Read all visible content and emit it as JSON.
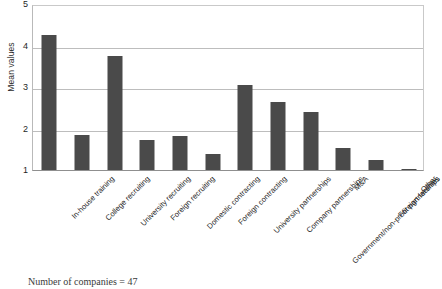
{
  "chart_data": {
    "type": "bar",
    "title": "",
    "xlabel": "",
    "ylabel": "Mean values",
    "ylim": [
      1,
      5
    ],
    "yticks": [
      1,
      2,
      3,
      4,
      5
    ],
    "ytick_labels": [
      "1",
      "2",
      "3",
      "4",
      "5"
    ],
    "grid": true,
    "legend": false,
    "bar_color": "#4a4a4a",
    "categories": [
      "In-house training",
      "College recruiting",
      "University recruiting",
      "Foreign recruiting",
      "Domestic contracting",
      "Foreign contracting",
      "University partnerships",
      "Company partnerships",
      "Government/non-profit partnerships",
      "M&A",
      "Foreign facilities",
      "Other"
    ],
    "values": [
      4.26,
      1.85,
      3.75,
      1.73,
      1.82,
      1.38,
      3.06,
      2.65,
      2.39,
      1.54,
      1.25,
      1.02
    ]
  },
  "caption": {
    "text": "Number of companies = 47"
  }
}
